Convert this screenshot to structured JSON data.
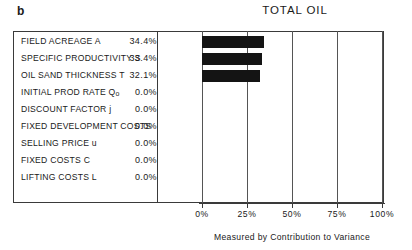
{
  "figure": {
    "panel_letter": "b",
    "title": "TOTAL OIL",
    "axis_caption": "Measured by Contribution to Variance"
  },
  "chart_data": {
    "type": "bar",
    "orientation": "horizontal",
    "title": "TOTAL OIL",
    "xlabel": "Measured by Contribution to Variance",
    "ylabel": "",
    "xlim": [
      0,
      100
    ],
    "x_unit": "%",
    "grid": true,
    "legend": "none",
    "tick_labels": [
      "0%",
      "25%",
      "50%",
      "75%",
      "100%"
    ],
    "tick_values": [
      0,
      25,
      50,
      75,
      100
    ],
    "categories": [
      "FIELD ACREAGE A",
      "SPECIFIC PRODUCTIVITY S",
      "OIL SAND THICKNESS T",
      "INITIAL PROD RATE Qo",
      "DISCOUNT FACTOR j",
      "FIXED DEVELOPMENT COSTS",
      "SELLING PRICE u",
      "FIXED COSTS C",
      "LIFTING COSTS L"
    ],
    "values": [
      34.4,
      33.4,
      32.1,
      0.0,
      0.0,
      0.0,
      0.0,
      0.0,
      0.0
    ],
    "value_labels": [
      "34.4%",
      "33.4%",
      "32.1%",
      "0.0%",
      "0.0%",
      "0.0%",
      "0.0%",
      "0.0%",
      "0.0%"
    ],
    "bar_color": "#141414"
  },
  "table": {
    "rows": [
      {
        "label": "FIELD ACREAGE A",
        "value": "34.4%",
        "pct": 34.4
      },
      {
        "label": "SPECIFIC PRODUCTIVITY S",
        "value": "33.4%",
        "pct": 33.4
      },
      {
        "label": "OIL SAND THICKNESS T",
        "value": "32.1%",
        "pct": 32.1
      },
      {
        "label": "INITIAL PROD RATE Qo",
        "value": "0.0%",
        "pct": 0.0
      },
      {
        "label": "DISCOUNT FACTOR j",
        "value": "0.0%",
        "pct": 0.0
      },
      {
        "label": "FIXED DEVELOPMENT COSTS",
        "value": "0.0%",
        "pct": 0.0
      },
      {
        "label": "SELLING PRICE u",
        "value": "0.0%",
        "pct": 0.0
      },
      {
        "label": "FIXED COSTS C",
        "value": "0.0%",
        "pct": 0.0
      },
      {
        "label": "LIFTING COSTS L",
        "value": "0.0%",
        "pct": 0.0
      }
    ]
  },
  "axis": {
    "ticks": [
      "0%",
      "25%",
      "50%",
      "75%",
      "100%"
    ]
  },
  "colors": {
    "bar": "#141414",
    "rule": "#3a3a3a",
    "text": "#1a1a1a",
    "background": "#ffffff"
  }
}
